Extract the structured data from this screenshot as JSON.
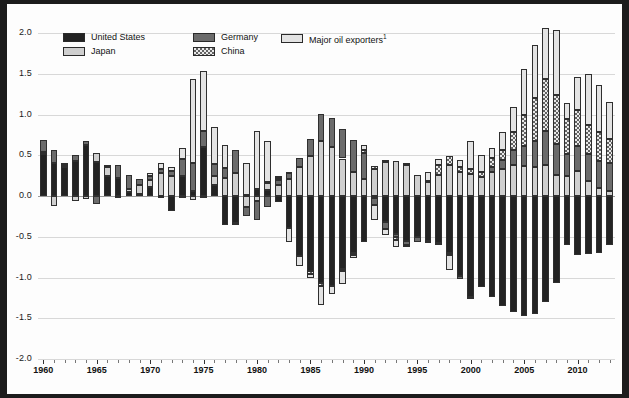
{
  "chart_data": {
    "type": "bar",
    "stacked": true,
    "title": "",
    "subtitle": "",
    "xlabel": "",
    "ylabel": "",
    "ylim": [
      -2.0,
      2.0
    ],
    "ytick_labels": [
      "2.0",
      "1.5",
      "1.0",
      "0.5",
      "0.0",
      "-0.5",
      "-1.0",
      "-1.5",
      "-2.0"
    ],
    "ytick_values": [
      2.0,
      1.5,
      1.0,
      0.5,
      0.0,
      -0.5,
      -1.0,
      -1.5,
      -2.0
    ],
    "xtick_labels": [
      "1960",
      "1965",
      "1970",
      "1975",
      "1980",
      "1985",
      "1990",
      "1995",
      "2000",
      "2005",
      "2010"
    ],
    "xtick_values": [
      1960,
      1965,
      1970,
      1975,
      1980,
      1985,
      1990,
      1995,
      2000,
      2005,
      2010
    ],
    "grid": true,
    "legend_position": "top-inside",
    "x": [
      1960,
      1961,
      1962,
      1963,
      1964,
      1965,
      1966,
      1967,
      1968,
      1969,
      1970,
      1971,
      1972,
      1973,
      1974,
      1975,
      1976,
      1977,
      1978,
      1979,
      1980,
      1981,
      1982,
      1983,
      1984,
      1985,
      1986,
      1987,
      1988,
      1989,
      1990,
      1991,
      1992,
      1993,
      1994,
      1995,
      1996,
      1997,
      1998,
      1999,
      2000,
      2001,
      2002,
      2003,
      2004,
      2005,
      2006,
      2007,
      2008,
      2009,
      2010,
      2011,
      2012,
      2013
    ],
    "series": [
      {
        "name": "United States",
        "color": "#232323",
        "pattern": "solid",
        "values": [
          0.52,
          0.4,
          0.36,
          0.43,
          0.62,
          0.42,
          0.25,
          0.22,
          0.05,
          0.03,
          0.11,
          -0.02,
          -0.18,
          0.24,
          0.06,
          0.6,
          0.14,
          -0.35,
          -0.33,
          0.01,
          0.08,
          0.07,
          -0.07,
          -0.39,
          -0.74,
          -0.92,
          -1.07,
          -1.1,
          -0.9,
          -0.7,
          -0.56,
          -0.03,
          -0.32,
          -0.47,
          -0.55,
          -0.5,
          -0.55,
          -0.58,
          -0.7,
          -0.98,
          -1.24,
          -1.12,
          -1.24,
          -1.35,
          -1.42,
          -1.47,
          -1.45,
          -1.3,
          -1.07,
          -0.6,
          -0.73,
          -0.71,
          -0.7,
          -0.6
        ]
      },
      {
        "name": "Japan",
        "color": "#cfcfcf",
        "pattern": "solid",
        "values": [
          0.02,
          -0.12,
          0.02,
          -0.06,
          -0.04,
          0.11,
          0.11,
          -0.02,
          0.04,
          0.11,
          0.09,
          0.28,
          0.25,
          -0.01,
          -0.05,
          -0.01,
          0.1,
          0.22,
          0.28,
          -0.14,
          -0.06,
          0.09,
          0.13,
          0.21,
          0.35,
          0.49,
          0.67,
          0.6,
          0.46,
          0.29,
          0.21,
          0.33,
          0.42,
          0.43,
          0.38,
          0.26,
          0.17,
          0.26,
          0.38,
          0.3,
          0.27,
          0.23,
          0.29,
          0.33,
          0.38,
          0.37,
          0.35,
          0.38,
          0.26,
          0.24,
          0.31,
          0.18,
          0.1,
          0.06
        ]
      },
      {
        "name": "Germany",
        "color": "#6b6b6b",
        "pattern": "solid",
        "values": [
          0.15,
          0.16,
          0.02,
          0.07,
          0.05,
          -0.1,
          0.02,
          0.16,
          0.17,
          0.07,
          0.04,
          0.05,
          0.06,
          0.22,
          0.35,
          0.2,
          0.15,
          0.12,
          0.28,
          -0.1,
          -0.23,
          -0.13,
          0.07,
          0.07,
          0.12,
          0.21,
          0.34,
          0.36,
          0.36,
          0.4,
          0.32,
          -0.08,
          -0.08,
          -0.03,
          -0.05,
          -0.06,
          -0.02,
          -0.01,
          -0.02,
          -0.04,
          -0.01,
          0.0,
          0.07,
          0.11,
          0.18,
          0.24,
          0.32,
          0.42,
          0.38,
          0.28,
          0.3,
          0.34,
          0.33,
          0.34
        ]
      },
      {
        "name": "China",
        "color": "#7a7a7a",
        "pattern": "checker",
        "values": [
          0.0,
          0.0,
          0.0,
          0.0,
          0.0,
          0.0,
          0.0,
          0.0,
          0.0,
          0.0,
          0.0,
          0.0,
          0.0,
          0.0,
          0.0,
          0.0,
          0.0,
          0.0,
          0.0,
          0.0,
          0.0,
          0.01,
          0.02,
          0.02,
          0.0,
          -0.04,
          -0.03,
          0.0,
          -0.02,
          -0.02,
          0.04,
          0.04,
          0.02,
          -0.04,
          0.03,
          0.0,
          0.02,
          0.12,
          0.11,
          0.06,
          0.06,
          0.06,
          0.11,
          0.13,
          0.22,
          0.38,
          0.53,
          0.64,
          0.6,
          0.42,
          0.45,
          0.35,
          0.35,
          0.3
        ]
      },
      {
        "name": "Major oil exporters",
        "color": "#e3e3e3",
        "pattern": "solid",
        "values": [
          0.0,
          0.0,
          0.0,
          0.0,
          0.0,
          0.0,
          0.0,
          0.0,
          0.0,
          0.0,
          0.04,
          0.08,
          0.05,
          0.13,
          1.02,
          0.73,
          0.46,
          0.28,
          -0.03,
          0.4,
          0.72,
          0.5,
          0.03,
          -0.17,
          -0.12,
          -0.05,
          -0.24,
          -0.1,
          -0.16,
          -0.04,
          0.05,
          -0.18,
          -0.08,
          -0.09,
          -0.02,
          0.0,
          0.11,
          0.07,
          -0.19,
          0.08,
          0.35,
          0.21,
          0.12,
          0.21,
          0.31,
          0.57,
          0.65,
          0.62,
          0.8,
          0.2,
          0.4,
          0.63,
          0.58,
          0.45
        ]
      }
    ],
    "footnote_marker": "1"
  },
  "legend": {
    "items": [
      {
        "label": "United States",
        "key": "us"
      },
      {
        "label": "Japan",
        "key": "japan"
      },
      {
        "label": "Germany",
        "key": "germany"
      },
      {
        "label": "China",
        "key": "china"
      },
      {
        "label": "Major oil exporters",
        "key": "oil",
        "superscript": "1"
      }
    ]
  },
  "colors": {
    "united_states": "#232323",
    "japan": "#cfcfcf",
    "germany": "#6b6b6b",
    "china": "#7a7a7a",
    "major_oil_exporters": "#e3e3e3",
    "grid": "#d8d8d8",
    "axis": "#9a9a9a",
    "background": "#fdfdfd",
    "frame": "#1c1c1c"
  }
}
